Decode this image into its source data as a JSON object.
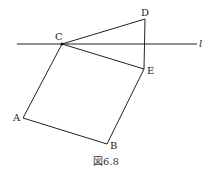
{
  "figure": {
    "caption": "図6.8",
    "line_label": "l",
    "points": {
      "A": {
        "label": "A",
        "x": 23,
        "y": 118
      },
      "B": {
        "label": "B",
        "x": 107,
        "y": 144
      },
      "C": {
        "label": "C",
        "x": 62,
        "y": 44
      },
      "D": {
        "label": "D",
        "x": 145,
        "y": 19
      },
      "E": {
        "label": "E",
        "x": 144,
        "y": 69
      }
    },
    "segments": [
      "CA",
      "AB",
      "BE",
      "EC",
      "CD",
      "DE"
    ],
    "line": {
      "x1": 17,
      "y1": 44,
      "x2": 197,
      "y2": 44
    },
    "stroke_color": "#222222"
  }
}
